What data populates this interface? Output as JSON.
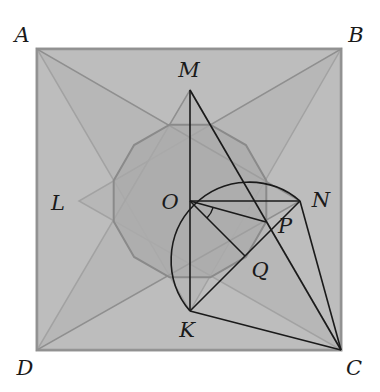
{
  "diagram": {
    "title": "",
    "colors": {
      "square_fill": "#c9c9c9",
      "square_stroke": "#9a9a9a",
      "triangle_fill": "#b2b2b2",
      "triangle_stroke": "#8f8f8f",
      "dodecagon_fill": "#a8a8a8",
      "dodecagon_stroke": "#8a8a8a",
      "line": "#1a1a1a"
    },
    "points": {
      "A": {
        "label": "A",
        "x": 37,
        "y": 49,
        "lx": 22,
        "ly": 35
      },
      "B": {
        "label": "B",
        "x": 341,
        "y": 49,
        "lx": 356,
        "ly": 35
      },
      "C": {
        "label": "C",
        "x": 341,
        "y": 350,
        "lx": 354,
        "ly": 368
      },
      "D": {
        "label": "D",
        "x": 37,
        "y": 350,
        "lx": 25,
        "ly": 368
      },
      "M": {
        "label": "M",
        "x": 190,
        "y": 90,
        "lx": 189,
        "ly": 70
      },
      "N": {
        "label": "N",
        "x": 300,
        "y": 201,
        "lx": 321,
        "ly": 200
      },
      "K": {
        "label": "K",
        "x": 190,
        "y": 311,
        "lx": 187,
        "ly": 330
      },
      "L": {
        "label": "L",
        "x": 79,
        "y": 201,
        "lx": 58,
        "ly": 203
      },
      "O": {
        "label": "O",
        "x": 190,
        "y": 201,
        "lx": 170,
        "ly": 202
      },
      "P": {
        "label": "P",
        "x": 266,
        "y": 222,
        "lx": 285,
        "ly": 226
      },
      "Q": {
        "label": "Q",
        "x": 245,
        "y": 256,
        "lx": 260,
        "ly": 270
      }
    },
    "segments": [
      [
        "M",
        "K"
      ],
      [
        "O",
        "N"
      ],
      [
        "O",
        "P"
      ],
      [
        "O",
        "Q"
      ],
      [
        "M",
        "C"
      ],
      [
        "N",
        "C"
      ],
      [
        "K",
        "C"
      ],
      [
        "K",
        "N"
      ]
    ],
    "triangles": [
      [
        "A",
        "B",
        "K"
      ],
      [
        "B",
        "C",
        "L"
      ],
      [
        "C",
        "D",
        "M"
      ],
      [
        "D",
        "A",
        "N"
      ]
    ],
    "arc": {
      "center": "Q",
      "radius": 78,
      "from": "K",
      "to": "N"
    },
    "angle_marker": {
      "vertex": "O",
      "between": [
        "P",
        "Q"
      ],
      "radius": 24
    },
    "dodecagon": {
      "cx": 190,
      "cy": 201,
      "r": 79
    }
  }
}
